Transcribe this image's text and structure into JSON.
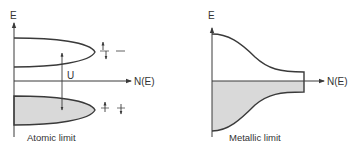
{
  "colors": {
    "line": "#3a3a3a",
    "fill": "#d9d9d9",
    "text": "#333333",
    "background": "#ffffff"
  },
  "left_panel": {
    "y_axis_label": "E",
    "x_axis_label": "N(E)",
    "gap_label": "U",
    "caption": "Atomic limit",
    "upper_band": "unfilled (empty upper Hubbard band)",
    "lower_band": "filled (occupied lower Hubbard band)",
    "upper_spin_glyphs": [
      "up-down-pair",
      "dash"
    ],
    "lower_spin_glyphs": [
      "spin-up",
      "spin-down"
    ]
  },
  "right_panel": {
    "y_axis_label": "E",
    "x_axis_label": "N(E)",
    "caption": "Metallic limit",
    "upper_region": "unfilled",
    "lower_region": "filled"
  }
}
